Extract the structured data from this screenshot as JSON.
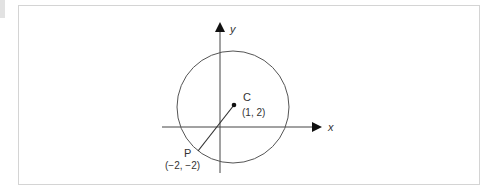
{
  "diagram": {
    "axes": {
      "x_label": "x",
      "y_label": "y"
    },
    "center": {
      "name": "C",
      "coords": "(1, 2)"
    },
    "point": {
      "name": "P",
      "coords": "(−2, −2)"
    },
    "colors": {
      "stroke": "#333333",
      "frame": "#d4d4d4"
    }
  }
}
